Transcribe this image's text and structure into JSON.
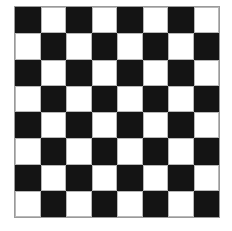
{
  "board": {
    "rows": 8,
    "cols": 8,
    "top_left": "dark",
    "colors": {
      "dark": "#141414",
      "light": "#ffffff",
      "border": "#9a9a9a"
    }
  }
}
